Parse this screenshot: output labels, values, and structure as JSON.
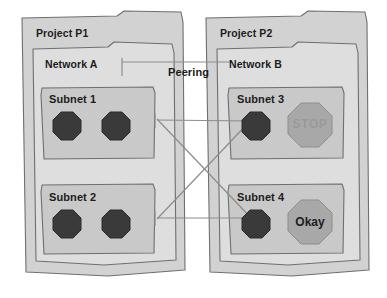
{
  "diagram": {
    "background_color": "#ffffff",
    "stroke_color": "#6f6f6f",
    "text_color": "#1c1c1c"
  },
  "colors": {
    "project_fill": "#d2d2d2",
    "network_fill": "#dedede",
    "subnet_fill": "#c9c9c9",
    "vm_dark_fill": "#3a3a3a",
    "vm_gray_fill": "#a8a8a8",
    "stop_text": "#9a9a9a",
    "line": "#8c8c8c"
  },
  "projects": [
    {
      "id": "p1",
      "label": "Project P1",
      "network": {
        "id": "network-a",
        "label": "Network A"
      },
      "subnets": [
        {
          "id": "subnet-1",
          "label": "Subnet 1",
          "instances": [
            {
              "id": "p1-s1-vm1",
              "label": "",
              "style": "dark"
            },
            {
              "id": "p1-s1-vm2",
              "label": "",
              "style": "dark"
            }
          ]
        },
        {
          "id": "subnet-2",
          "label": "Subnet 2",
          "instances": [
            {
              "id": "p1-s2-vm1",
              "label": "",
              "style": "dark"
            },
            {
              "id": "p1-s2-vm2",
              "label": "",
              "style": "dark"
            }
          ]
        }
      ]
    },
    {
      "id": "p2",
      "label": "Project P2",
      "network": {
        "id": "network-b",
        "label": "Network B"
      },
      "subnets": [
        {
          "id": "subnet-3",
          "label": "Subnet 3",
          "instances": [
            {
              "id": "p2-s3-vm1",
              "label": "",
              "style": "dark"
            },
            {
              "id": "p2-s3-vm2",
              "label": "STOP",
              "style": "gray"
            }
          ]
        },
        {
          "id": "subnet-4",
          "label": "Subnet 4",
          "instances": [
            {
              "id": "p2-s4-vm1",
              "label": "",
              "style": "dark"
            },
            {
              "id": "p2-s4-vm2",
              "label": "Okay",
              "style": "gray"
            }
          ]
        }
      ]
    }
  ],
  "connection": {
    "label": "Peering",
    "links": [
      {
        "from": "subnet-1",
        "to": "subnet-3",
        "kind": "horizontal"
      },
      {
        "from": "subnet-2",
        "to": "subnet-4",
        "kind": "horizontal"
      },
      {
        "from": "subnet-1",
        "to": "subnet-4",
        "kind": "diagonal"
      },
      {
        "from": "subnet-2",
        "to": "subnet-3",
        "kind": "diagonal"
      }
    ]
  }
}
